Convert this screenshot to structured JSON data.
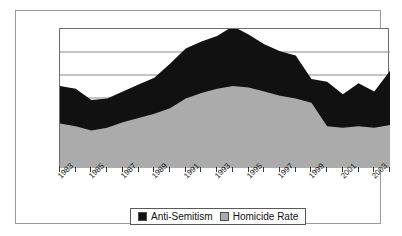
{
  "chart_data": {
    "type": "area",
    "stacked": true,
    "title": "",
    "subtitle": "",
    "xlabel": "",
    "ylabel": "",
    "grid": true,
    "gridlines": 4,
    "legend_position": "bottom",
    "x": [
      1983,
      1984,
      1985,
      1986,
      1987,
      1988,
      1989,
      1990,
      1991,
      1992,
      1993,
      1994,
      1995,
      1996,
      1997,
      1998,
      1999,
      2000,
      2001,
      2002,
      2003,
      2004
    ],
    "categories": [
      "1983",
      "1984",
      "1985",
      "1986",
      "1987",
      "1988",
      "1989",
      "1990",
      "1991",
      "1992",
      "1993",
      "1994",
      "1995",
      "1996",
      "1997",
      "1998",
      "1999",
      "2000",
      "2001",
      "2002",
      "2003",
      "2004"
    ],
    "tick_labels": [
      "1983",
      "1985",
      "1987",
      "1989",
      "1991",
      "1993",
      "1995",
      "1997",
      "1999",
      "2001",
      "2003"
    ],
    "ylim": [
      0,
      100
    ],
    "series": [
      {
        "name": "Homicide Rate",
        "color": "#ababab",
        "values": [
          32,
          30,
          27,
          29,
          33,
          36,
          39,
          43,
          50,
          54,
          57,
          59,
          58,
          55,
          52,
          50,
          47,
          30,
          29,
          30,
          29,
          31
        ]
      },
      {
        "name": "Anti-Semitism",
        "color": "#111111",
        "values": [
          27,
          27,
          22,
          21,
          22,
          24,
          26,
          32,
          36,
          37,
          38,
          43,
          38,
          34,
          32,
          31,
          17,
          32,
          24,
          31,
          26,
          39
        ]
      }
    ],
    "series_totals": [
      59,
      57,
      49,
      50,
      55,
      60,
      65,
      75,
      86,
      91,
      95,
      102,
      96,
      89,
      84,
      81,
      64,
      62,
      53,
      61,
      55,
      70
    ]
  },
  "legend": {
    "entries": [
      {
        "label": "Anti-Semitism",
        "swatch": "#111111"
      },
      {
        "label": "Homicide Rate",
        "swatch": "#ababab"
      }
    ]
  },
  "colors": {
    "series_black": "#111111",
    "series_gray": "#ababab",
    "gridline": "#8a8a8a",
    "axis": "#3a3a3a",
    "frame": "#9a9a9a",
    "background": "#ffffff"
  }
}
